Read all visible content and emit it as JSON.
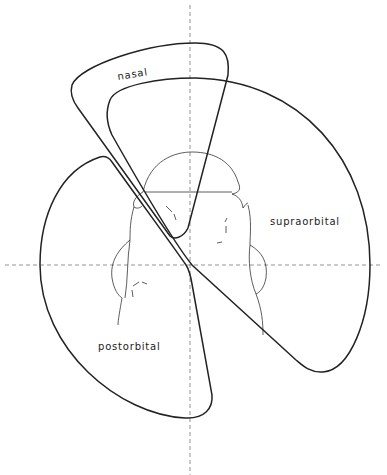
{
  "diagram": {
    "type": "anatomical-field-diagram",
    "labels": {
      "nasal": "nasal",
      "supraorbital": "supraorbital",
      "postorbital": "postorbital"
    },
    "regions": [
      {
        "id": "nasal",
        "label": "nasal"
      },
      {
        "id": "supraorbital",
        "label": "supraorbital"
      },
      {
        "id": "postorbital",
        "label": "postorbital"
      }
    ],
    "axes": {
      "vertical": "dashed",
      "horizontal": "dashed"
    },
    "colors": {
      "line": "#222222",
      "axis": "#666666",
      "background": "#ffffff"
    }
  }
}
